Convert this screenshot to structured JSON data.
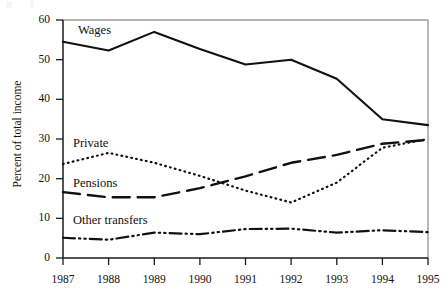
{
  "chart_data": {
    "type": "line",
    "title": "",
    "xlabel": "",
    "ylabel": "Percent of total income",
    "x": [
      1987,
      1988,
      1989,
      1990,
      1991,
      1992,
      1993,
      1994,
      1995
    ],
    "xticklabels": [
      "1987",
      "1988",
      "1989",
      "1990",
      "1991",
      "1992",
      "1993",
      "1994",
      "1995"
    ],
    "yticklabels": [
      "0",
      "10",
      "20",
      "30",
      "40",
      "50",
      "60"
    ],
    "yticks": [
      0,
      10,
      20,
      30,
      40,
      50,
      60
    ],
    "ylim": [
      0,
      60
    ],
    "xlim": [
      1987,
      1995
    ],
    "grid": false,
    "legend_position": "inline-labels",
    "series": [
      {
        "name": "Wages",
        "style": "solid",
        "color": "#111111",
        "values": [
          54.5,
          52.3,
          57.0,
          52.7,
          48.8,
          50.0,
          45.2,
          35.0,
          33.5
        ],
        "label_text": "Wages"
      },
      {
        "name": "Private",
        "style": "dotted",
        "color": "#111111",
        "values": [
          23.7,
          26.5,
          24.0,
          20.7,
          17.0,
          14.0,
          19.0,
          27.8,
          30.0
        ],
        "label_text": "Private"
      },
      {
        "name": "Pensions",
        "style": "dashed",
        "color": "#111111",
        "values": [
          16.6,
          15.3,
          15.3,
          17.6,
          20.6,
          24.0,
          26.0,
          28.8,
          29.8
        ],
        "label_text": "Pensions"
      },
      {
        "name": "Other transfers",
        "style": "dash-dot-dot",
        "color": "#111111",
        "values": [
          5.1,
          4.6,
          6.4,
          6.0,
          7.3,
          7.4,
          6.4,
          7.0,
          6.5
        ],
        "label_text": "Other transfers"
      }
    ]
  },
  "axis": {
    "y_label": "Percent of total income",
    "y_ticks": [
      "60",
      "50",
      "40",
      "30",
      "20",
      "10",
      "0"
    ],
    "x_ticks": [
      "1987",
      "1988",
      "1989",
      "1990",
      "1991",
      "1992",
      "1993",
      "1994",
      "1995"
    ]
  },
  "labels": {
    "wages": "Wages",
    "private": "Private",
    "pensions": "Pensions",
    "other_transfers": "Other transfers"
  },
  "colors": {
    "line": "#111111",
    "frame": "#8c8c8c",
    "axis": "#222222",
    "background": "#ffffff"
  }
}
